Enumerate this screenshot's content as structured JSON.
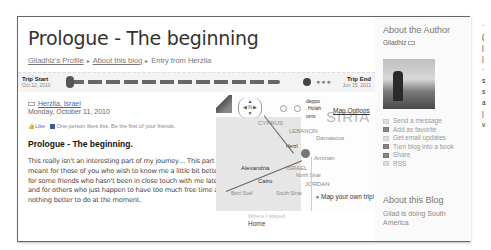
{
  "post": {
    "title": "Prologue - The beginning",
    "breadcrumbs": [
      {
        "label": "Giladhiz's Profile"
      },
      {
        "label": "About this blog"
      },
      {
        "label": "Entry from Herzlia"
      }
    ],
    "breadcrumb_separator": "▸",
    "location": "Herzlia, Israel",
    "date": "Monday, October 11, 2010",
    "like_label": "Like",
    "like_text": "One person likes this. Be the first of your friends.",
    "heading": "Prologue - The beginning.",
    "body": "This really isn't an interesting part of my journey… This part is meant for those of you who wish to know me a little bit better, for some friends who hasn't been in close touch with me lately and for others who just happen to have too much free time and nothing better to do at the moment."
  },
  "timeline": {
    "start_label": "Trip Start",
    "start_date": "Oct 12, 2010",
    "end_label": "Trip End",
    "end_date": "Jun 15, 2011",
    "dots": "●●●"
  },
  "map": {
    "options_label": "Map Options",
    "own_trip_label": "Map your own trip!",
    "nav_label": "N",
    "labels": {
      "syria": "SIRIA",
      "cyprus": "CYPRUS",
      "lebanon": "LEBANON",
      "damascus": "Damascus",
      "amman": "Amman",
      "israel": "ISRAEL",
      "alexandria": "Alexandria",
      "cairo": "Cairo",
      "jordan": "JORDAN",
      "north_sinai": "North Sinai",
      "south_sinai": "South Sinai",
      "beni_suef": "Beni Suef",
      "herzlia": "Herzl",
      "deppo": "deppo",
      "holah": "Holah",
      "homs": "oms"
    }
  },
  "where": {
    "label": "Where I stayed",
    "value": "Home"
  },
  "sidebar": {
    "about_author_title": "About the Author",
    "author_name": "Giladhiz",
    "actions": [
      {
        "label": "Send a message",
        "icon": "envelope-icon"
      },
      {
        "label": "Add as favorite",
        "icon": "heart-icon"
      },
      {
        "label": "Get email updates",
        "icon": "email-icon"
      },
      {
        "label": "Turn blog into a book",
        "icon": "book-icon"
      },
      {
        "label": "Share",
        "icon": "share-icon"
      },
      {
        "label": "RSS",
        "icon": "rss-icon"
      }
    ],
    "about_blog_title": "About this Blog",
    "blog_description": "Gilad is doing South America"
  }
}
